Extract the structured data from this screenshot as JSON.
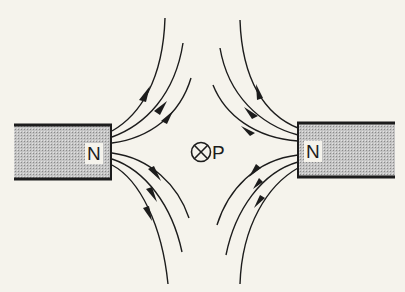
{
  "diagram": {
    "type": "magnetic-field-lines",
    "magnets": [
      {
        "id": "left-magnet",
        "pole_label": "N",
        "side": "left"
      },
      {
        "id": "right-magnet",
        "pole_label": "N",
        "side": "right"
      }
    ],
    "point": {
      "symbol": "⊗",
      "label": "P",
      "meaning": "into-page"
    },
    "colors": {
      "background": "#f5f3ec",
      "line": "#1c1c1c",
      "magnet_fill": "#bdbdbd"
    }
  }
}
